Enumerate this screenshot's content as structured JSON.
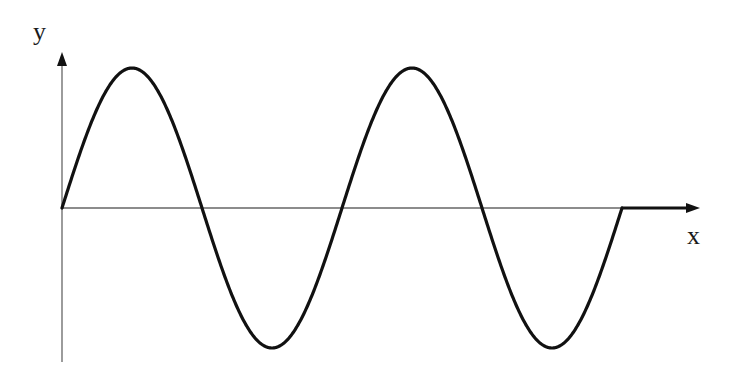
{
  "diagram": {
    "title": "",
    "axes": {
      "x_label": "x",
      "y_label": "y",
      "origin_px": [
        62,
        208
      ]
    },
    "curve": {
      "type": "sine",
      "cycles": 2,
      "amplitude_px": 140,
      "half_period_px": 140,
      "start_x_px": 62,
      "end_x_px": 622,
      "after_end": "flat line along x-axis to arrow",
      "color": "#111111"
    },
    "colors": {
      "axis": "#666666",
      "curve": "#111111",
      "background": "#ffffff"
    }
  },
  "chart_data": {
    "type": "line",
    "title": "",
    "xlabel": "x",
    "ylabel": "y",
    "series": [
      {
        "name": "y = sin(x) for 2 periods, then 0",
        "x": [
          0,
          0.25,
          0.5,
          0.75,
          1,
          1.25,
          1.5,
          1.75,
          2,
          2.27
        ],
        "y": [
          0,
          1,
          0,
          -1,
          0,
          1,
          0,
          -1,
          0,
          0
        ]
      }
    ],
    "grid": false,
    "legend": null
  }
}
